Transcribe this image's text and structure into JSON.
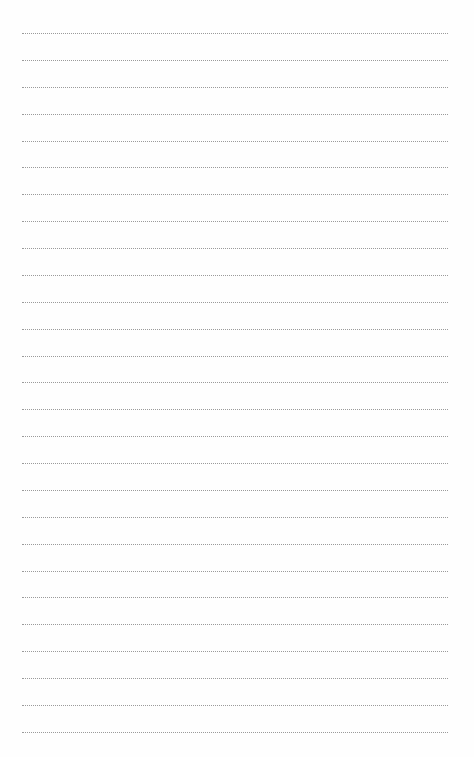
{
  "page": {
    "type": "blank-lined-notepaper",
    "background_color": "#fefefe",
    "rule_style": "dotted",
    "rule_color": "#9a9a9a",
    "rule_count": 27,
    "first_rule_y": 33,
    "rule_spacing": 26.88,
    "rule_left_x": 22,
    "rule_right_x": 448
  }
}
